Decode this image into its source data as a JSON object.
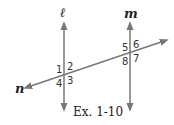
{
  "diagram": {
    "lines": {
      "l": {
        "label": "ℓ"
      },
      "m": {
        "label": "m"
      },
      "n": {
        "label": "n"
      }
    },
    "angles_at_l": {
      "a1": "1",
      "a2": "2",
      "a3": "3",
      "a4": "4"
    },
    "angles_at_m": {
      "a5": "5",
      "a6": "6",
      "a7": "7",
      "a8": "8"
    },
    "caption": "Ex. 1-10",
    "line_color": "#777777"
  }
}
